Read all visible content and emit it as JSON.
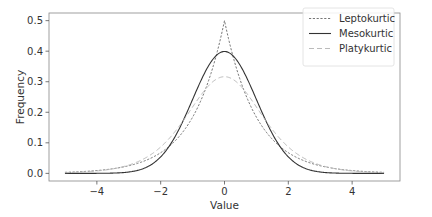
{
  "chart_data": {
    "type": "line",
    "title": "",
    "xlabel": "Value",
    "ylabel": "Frequency",
    "xlim": [
      -5.5,
      5.5
    ],
    "ylim": [
      -0.025,
      0.525
    ],
    "grid": false,
    "legend_position": "upper right",
    "x_ticks": [
      -4,
      -2,
      0,
      2,
      4
    ],
    "x_tick_labels": [
      "−4",
      "−2",
      "0",
      "2",
      "4"
    ],
    "y_ticks": [
      0.0,
      0.1,
      0.2,
      0.3,
      0.4,
      0.5
    ],
    "y_tick_labels": [
      "0.0",
      "0.1",
      "0.2",
      "0.3",
      "0.4",
      "0.5"
    ],
    "x": [
      -5,
      -4.5,
      -4,
      -3.5,
      -3,
      -2.5,
      -2,
      -1.75,
      -1.5,
      -1.25,
      -1,
      -0.75,
      -0.5,
      -0.25,
      0,
      0.25,
      0.5,
      0.75,
      1,
      1.25,
      1.5,
      1.75,
      2,
      2.5,
      3,
      3.5,
      4,
      4.5,
      5
    ],
    "series": [
      {
        "name": "Leptokurtic",
        "style": "dotted",
        "color": "#777777",
        "values": [
          0.003,
          0.006,
          0.009,
          0.015,
          0.025,
          0.041,
          0.068,
          0.087,
          0.112,
          0.143,
          0.184,
          0.236,
          0.303,
          0.389,
          0.5,
          0.389,
          0.303,
          0.236,
          0.184,
          0.143,
          0.112,
          0.087,
          0.068,
          0.041,
          0.025,
          0.015,
          0.009,
          0.006,
          0.003
        ]
      },
      {
        "name": "Mesokurtic",
        "style": "solid",
        "color": "#333333",
        "values": [
          0.0,
          0.0,
          0.0001,
          0.0009,
          0.0044,
          0.0175,
          0.054,
          0.0863,
          0.1295,
          0.1826,
          0.242,
          0.3011,
          0.3521,
          0.3867,
          0.3989,
          0.3867,
          0.3521,
          0.3011,
          0.242,
          0.1826,
          0.1295,
          0.0863,
          0.054,
          0.0175,
          0.0044,
          0.0009,
          0.0001,
          0.0,
          0.0
        ]
      },
      {
        "name": "Platykurtic",
        "style": "dashed",
        "color": "#bbbbbb",
        "values": [
          0.002,
          0.004,
          0.008,
          0.014,
          0.026,
          0.046,
          0.08,
          0.104,
          0.134,
          0.168,
          0.206,
          0.245,
          0.28,
          0.306,
          0.316,
          0.306,
          0.28,
          0.245,
          0.206,
          0.168,
          0.134,
          0.104,
          0.08,
          0.046,
          0.026,
          0.014,
          0.008,
          0.004,
          0.002
        ]
      }
    ]
  },
  "layout": {
    "plot_left": 49,
    "plot_top": 13,
    "plot_right": 400,
    "plot_bottom": 181,
    "frame_color": "#888888"
  }
}
